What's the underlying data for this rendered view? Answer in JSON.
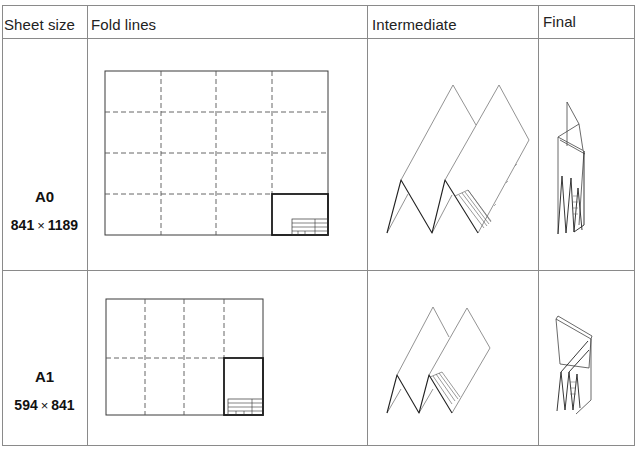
{
  "table": {
    "headers": [
      {
        "label": "Sheet size"
      },
      {
        "label": "Fold lines"
      },
      {
        "label": "Intermediate"
      },
      {
        "label": "Final"
      }
    ],
    "rows": [
      {
        "sheet_name": "A0",
        "width": "841",
        "times": "×",
        "height": "1189",
        "fold_grid": {
          "columns": 4,
          "rows": 4
        },
        "intermediate_icon": "accordion-fold-a0",
        "final_icon": "folded-packet-a0"
      },
      {
        "sheet_name": "A1",
        "width": "594",
        "times": "×",
        "height": "841",
        "fold_grid": {
          "columns": 4,
          "rows": 2
        },
        "intermediate_icon": "accordion-fold-a1",
        "final_icon": "folded-packet-a1"
      }
    ]
  },
  "colors": {
    "line": "#3a3a3a",
    "grid": "#8a8a8a",
    "title_block": "#1a1a1a"
  }
}
